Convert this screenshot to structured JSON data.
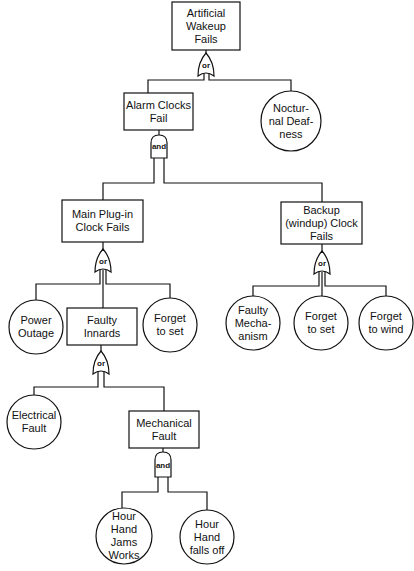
{
  "diagram": {
    "type": "fault-tree",
    "nodes": {
      "top": {
        "label": "Artificial\nWakeup\nFails",
        "kind": "event"
      },
      "alarm": {
        "label": "Alarm Clocks\nFail",
        "kind": "event"
      },
      "nocturnal": {
        "label": "Noctur-\nnal Deaf-\nness",
        "kind": "basic"
      },
      "mainplug": {
        "label": "Main Plug-in\nClock Fails",
        "kind": "event"
      },
      "backup": {
        "label": "Backup\n(windup) Clock\nFails",
        "kind": "event"
      },
      "power": {
        "label": "Power\nOutage",
        "kind": "basic"
      },
      "innards": {
        "label": "Faulty\nInnards",
        "kind": "event"
      },
      "forgetset1": {
        "label": "Forget\nto set",
        "kind": "basic"
      },
      "mechanism": {
        "label": "Faulty\nMecha-\nanism",
        "kind": "basic"
      },
      "forgetset2": {
        "label": "Forget\nto set",
        "kind": "basic"
      },
      "forgetwind": {
        "label": "Forget\nto wind",
        "kind": "basic"
      },
      "electrical": {
        "label": "Electrical\nFault",
        "kind": "basic"
      },
      "mechanical": {
        "label": "Mechanical\nFault",
        "kind": "event"
      },
      "jams": {
        "label": "Hour\nHand\nJams\nWorks",
        "kind": "basic"
      },
      "fallsoff": {
        "label": "Hour\nHand\nfalls off",
        "kind": "basic"
      }
    },
    "gates": {
      "g_top": {
        "label": "or",
        "type": "or"
      },
      "g_alarm": {
        "label": "and",
        "type": "and"
      },
      "g_mainplug": {
        "label": "or",
        "type": "or"
      },
      "g_backup": {
        "label": "or",
        "type": "or"
      },
      "g_innards": {
        "label": "or",
        "type": "or"
      },
      "g_mechanical": {
        "label": "and",
        "type": "and"
      }
    },
    "edges": [
      [
        "top",
        "g_top"
      ],
      [
        "g_top",
        "alarm"
      ],
      [
        "g_top",
        "nocturnal"
      ],
      [
        "alarm",
        "g_alarm"
      ],
      [
        "g_alarm",
        "mainplug"
      ],
      [
        "g_alarm",
        "backup"
      ],
      [
        "mainplug",
        "g_mainplug"
      ],
      [
        "g_mainplug",
        "power"
      ],
      [
        "g_mainplug",
        "innards"
      ],
      [
        "g_mainplug",
        "forgetset1"
      ],
      [
        "backup",
        "g_backup"
      ],
      [
        "g_backup",
        "mechanism"
      ],
      [
        "g_backup",
        "forgetset2"
      ],
      [
        "g_backup",
        "forgetwind"
      ],
      [
        "innards",
        "g_innards"
      ],
      [
        "g_innards",
        "electrical"
      ],
      [
        "g_innards",
        "mechanical"
      ],
      [
        "mechanical",
        "g_mechanical"
      ],
      [
        "g_mechanical",
        "jams"
      ],
      [
        "g_mechanical",
        "fallsoff"
      ]
    ],
    "colors": {
      "stroke": "#111111",
      "background": "#ffffff"
    }
  }
}
